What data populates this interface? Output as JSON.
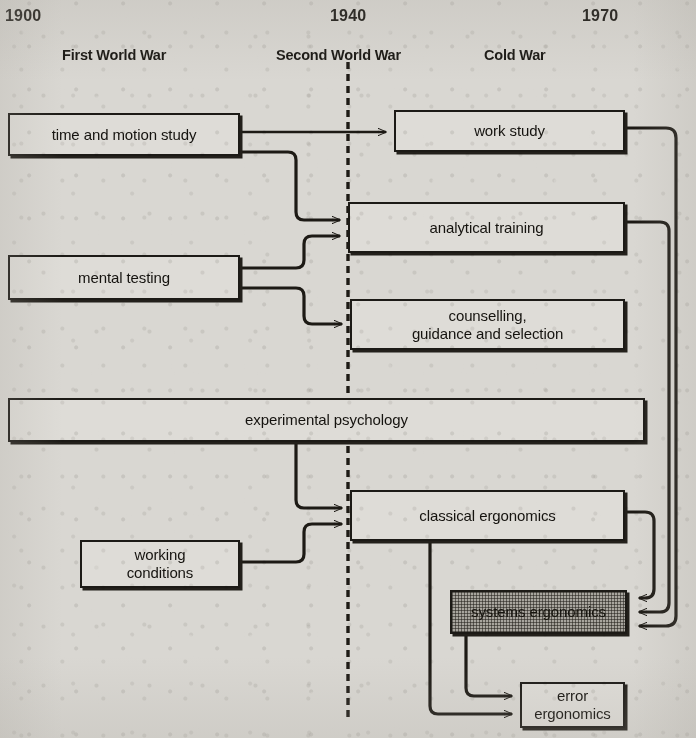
{
  "diagram": {
    "background_color": "#d9d7d2",
    "ink_color": "#1d1a15",
    "shaded_fill_color": "#a8a59e",
    "timeline": {
      "years": [
        {
          "label": "1900",
          "x": 5
        },
        {
          "label": "1940",
          "x": 330
        },
        {
          "label": "1970",
          "x": 582
        }
      ],
      "eras": [
        {
          "label": "First World War",
          "x": 62
        },
        {
          "label": "Second World War",
          "x": 276
        },
        {
          "label": "Cold War",
          "x": 484
        }
      ],
      "divider": {
        "name": "1940-divider",
        "x": 348,
        "y1": 62,
        "y2": 722,
        "style": "dashed"
      }
    },
    "nodes": [
      {
        "id": "time-and-motion-study",
        "label": "time and motion study",
        "x": 8,
        "y": 113,
        "w": 232,
        "h": 43,
        "shaded": false
      },
      {
        "id": "work-study",
        "label": "work study",
        "x": 394,
        "y": 110,
        "w": 231,
        "h": 42,
        "shaded": false
      },
      {
        "id": "mental-testing",
        "label": "mental testing",
        "x": 8,
        "y": 255,
        "w": 232,
        "h": 45,
        "shaded": false
      },
      {
        "id": "analytical-training",
        "label": "analytical training",
        "x": 348,
        "y": 202,
        "w": 277,
        "h": 51,
        "shaded": false
      },
      {
        "id": "counselling-guidance-and-selection",
        "label": "counselling,\nguidance and selection",
        "x": 350,
        "y": 299,
        "w": 275,
        "h": 51,
        "shaded": false
      },
      {
        "id": "experimental-psychology",
        "label": "experimental psychology",
        "x": 8,
        "y": 398,
        "w": 637,
        "h": 44,
        "shaded": false
      },
      {
        "id": "classical-ergonomics",
        "label": "classical ergonomics",
        "x": 350,
        "y": 490,
        "w": 275,
        "h": 51,
        "shaded": false
      },
      {
        "id": "working-conditions",
        "label": "working\nconditions",
        "x": 80,
        "y": 540,
        "w": 160,
        "h": 48,
        "shaded": false
      },
      {
        "id": "systems-ergonomics",
        "label": "systems ergonomics",
        "x": 450,
        "y": 590,
        "w": 177,
        "h": 44,
        "shaded": true
      },
      {
        "id": "error-ergonomics",
        "label": "error\nergonomics",
        "x": 520,
        "y": 682,
        "w": 105,
        "h": 46,
        "shaded": false
      }
    ],
    "edges": [
      {
        "id": "edge-time-motion-to-work-study",
        "from": "time-and-motion-study",
        "to": "work-study"
      },
      {
        "id": "edge-time-motion-to-analytical",
        "from": "time-and-motion-study",
        "to": "analytical-training"
      },
      {
        "id": "edge-mental-testing-to-analytical",
        "from": "mental-testing",
        "to": "analytical-training"
      },
      {
        "id": "edge-mental-testing-to-counselling",
        "from": "mental-testing",
        "to": "counselling-guidance-and-selection"
      },
      {
        "id": "edge-experimental-psych-to-classical",
        "from": "experimental-psychology",
        "to": "classical-ergonomics"
      },
      {
        "id": "edge-working-conditions-to-classical",
        "from": "working-conditions",
        "to": "classical-ergonomics"
      },
      {
        "id": "edge-work-study-to-systems",
        "from": "work-study",
        "to": "systems-ergonomics"
      },
      {
        "id": "edge-analytical-to-systems",
        "from": "analytical-training",
        "to": "systems-ergonomics"
      },
      {
        "id": "edge-classical-to-systems",
        "from": "classical-ergonomics",
        "to": "systems-ergonomics"
      },
      {
        "id": "edge-systems-to-error",
        "from": "systems-ergonomics",
        "to": "error-ergonomics"
      },
      {
        "id": "edge-classical-to-error",
        "from": "classical-ergonomics",
        "to": "error-ergonomics"
      }
    ]
  }
}
